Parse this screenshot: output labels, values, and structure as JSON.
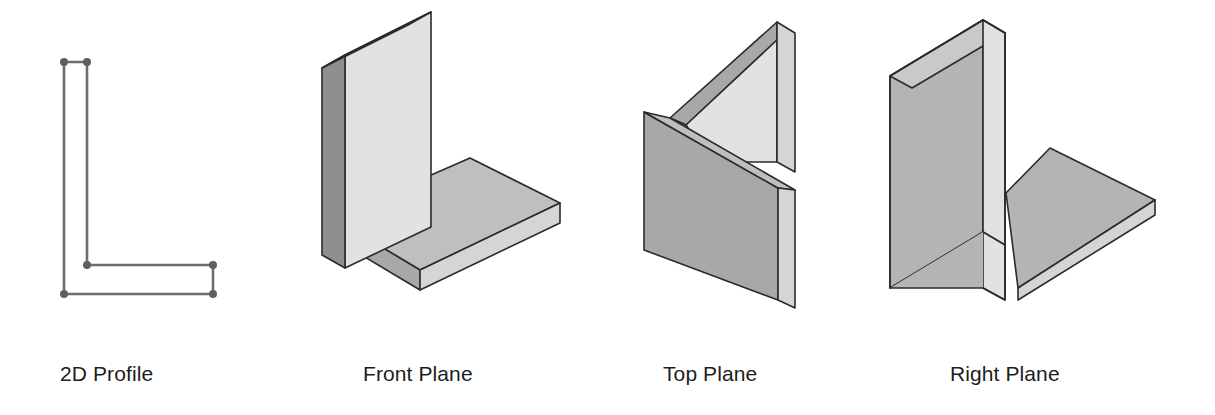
{
  "page": {
    "width": 1215,
    "height": 415,
    "background": "#ffffff"
  },
  "palette": {
    "outline": "#2b2b2b",
    "profile_line": "#6d6d6d",
    "profile_vertex": "#5e5e5e",
    "face_light": "#e2e2e2",
    "face_mid": "#bfbfbf",
    "face_dark": "#a8a8a8",
    "face_edge": "#d5d5d5",
    "caption_color": "#1d1d1d"
  },
  "figures": [
    {
      "id": "profile",
      "caption": "2D Profile",
      "kind": "sketch",
      "description": "L-shaped closed wire profile with visible endpoint vertices",
      "vertices": [
        {
          "x": 64,
          "y": 62
        },
        {
          "x": 87,
          "y": 62
        },
        {
          "x": 87,
          "y": 265
        },
        {
          "x": 213,
          "y": 265
        },
        {
          "x": 213,
          "y": 294
        },
        {
          "x": 64,
          "y": 294
        }
      ]
    },
    {
      "id": "front-plane",
      "caption": "Front Plane",
      "kind": "solid",
      "description": "L profile on the front plane extruded back/right; vertical wall on the left and horizontal slab at the bottom"
    },
    {
      "id": "top-plane",
      "caption": "Top Plane",
      "kind": "solid",
      "description": "L profile on the top plane extruded downward; chevron shaped slab standing vertically"
    },
    {
      "id": "right-plane",
      "caption": "Right Plane",
      "kind": "solid",
      "description": "L profile on the right plane extruded sideways; tall vertical panel with horizontal shelf to the right"
    }
  ],
  "captions": {
    "profile": "2D Profile",
    "front": "Front Plane",
    "top": "Top Plane",
    "right": "Right Plane"
  }
}
